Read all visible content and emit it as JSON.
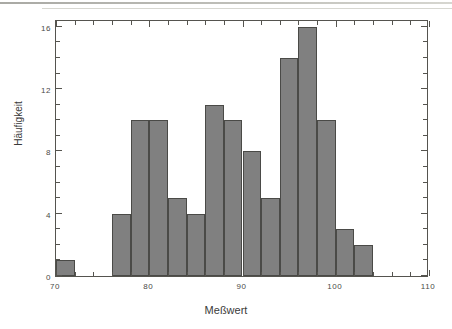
{
  "chart_data": {
    "type": "bar",
    "title": "",
    "subtitle": "",
    "xlabel": "Meßwert",
    "ylabel": "Häufigkeit",
    "xlim": [
      70,
      110
    ],
    "ylim": [
      0,
      16.5
    ],
    "grid": false,
    "legend": null,
    "bin_width": 2,
    "bar_color": "#808080",
    "bar_edge_color": "#4a4a47",
    "axis_color": "#55544f",
    "xticks": [
      70,
      80,
      90,
      100,
      110
    ],
    "xtick_labels": [
      "70",
      "80",
      "90",
      "100",
      "110"
    ],
    "xtick_minor_step": 2,
    "yticks": [
      0,
      4,
      8,
      12,
      16
    ],
    "ytick_labels": [
      "0",
      "4",
      "8",
      "12",
      "16"
    ],
    "ytick_minor_step": 1,
    "bins": [
      {
        "x0": 70,
        "x1": 72,
        "value": 1
      },
      {
        "x0": 76,
        "x1": 78,
        "value": 4
      },
      {
        "x0": 78,
        "x1": 80,
        "value": 10
      },
      {
        "x0": 80,
        "x1": 82,
        "value": 10
      },
      {
        "x0": 82,
        "x1": 84,
        "value": 5
      },
      {
        "x0": 84,
        "x1": 86,
        "value": 4
      },
      {
        "x0": 86,
        "x1": 88,
        "value": 11
      },
      {
        "x0": 88,
        "x1": 90,
        "value": 10
      },
      {
        "x0": 90,
        "x1": 92,
        "value": 8
      },
      {
        "x0": 92,
        "x1": 94,
        "value": 5
      },
      {
        "x0": 94,
        "x1": 96,
        "value": 14
      },
      {
        "x0": 96,
        "x1": 98,
        "value": 16
      },
      {
        "x0": 98,
        "x1": 100,
        "value": 10
      },
      {
        "x0": 100,
        "x1": 102,
        "value": 3
      },
      {
        "x0": 102,
        "x1": 104,
        "value": 2
      }
    ],
    "categories": [
      "70-72",
      "76-78",
      "78-80",
      "80-82",
      "82-84",
      "84-86",
      "86-88",
      "88-90",
      "90-92",
      "92-94",
      "94-96",
      "96-98",
      "98-100",
      "100-102",
      "102-104"
    ],
    "values": [
      1,
      4,
      10,
      10,
      5,
      4,
      11,
      10,
      8,
      5,
      14,
      16,
      10,
      3,
      2
    ]
  }
}
